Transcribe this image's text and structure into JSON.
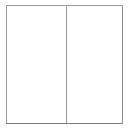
{
  "widget": {
    "name": "split-pane",
    "orientation": "vertical-divider",
    "background_color": "#ffffff",
    "border_color": "#9a9a9a",
    "divider_color": "#9a9a9a"
  },
  "panes": {
    "left": {
      "label": "",
      "content": ""
    },
    "right": {
      "label": "",
      "content": ""
    }
  },
  "divider": {
    "label": ""
  }
}
